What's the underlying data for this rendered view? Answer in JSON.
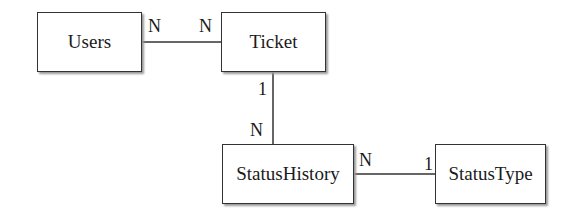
{
  "diagram": {
    "type": "entity-relationship",
    "entities": [
      {
        "id": "users",
        "label": "Users"
      },
      {
        "id": "ticket",
        "label": "Ticket"
      },
      {
        "id": "status_history",
        "label": "StatusHistory"
      },
      {
        "id": "status_type",
        "label": "StatusType"
      }
    ],
    "relationships": [
      {
        "from": "Users",
        "to": "Ticket",
        "from_cardinality": "N",
        "to_cardinality": "N"
      },
      {
        "from": "Ticket",
        "to": "StatusHistory",
        "from_cardinality": "1",
        "to_cardinality": "N"
      },
      {
        "from": "StatusHistory",
        "to": "StatusType",
        "from_cardinality": "N",
        "to_cardinality": "1"
      }
    ]
  }
}
